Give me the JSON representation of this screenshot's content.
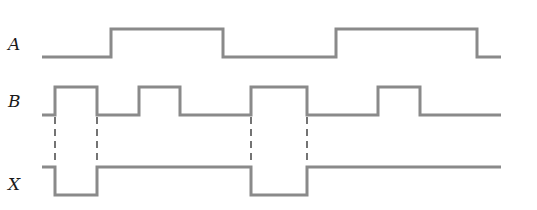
{
  "diagram": {
    "type": "timing-diagram",
    "colors": {
      "signal": "#8a8a8a",
      "dash": "#2a2a2a",
      "label": "#1a1a1a"
    },
    "signals": [
      {
        "name": "A",
        "label_y": 50,
        "high_y": 29,
        "low_y": 57,
        "points": "42,57 111,57 111,29 223,29 223,57 336,57 336,29 477,29 477,57 501,57"
      },
      {
        "name": "B",
        "label_y": 107,
        "high_y": 87,
        "low_y": 115,
        "points": "42,115 55,115 55,87 97,87 97,115 139,115 139,87 180,87 180,115 251,115 251,87 307,87 307,115 378,115 378,87 420,87 420,115 501,115"
      },
      {
        "name": "X",
        "label_y": 190,
        "high_y": 167,
        "low_y": 195,
        "points": "42,167 55,167 55,195 97,195 97,167 251,167 251,195 307,195 307,167 501,167"
      }
    ],
    "dashed_guides": [
      {
        "x": 55,
        "y1": 117,
        "y2": 165
      },
      {
        "x": 97,
        "y1": 117,
        "y2": 165
      },
      {
        "x": 251,
        "y1": 117,
        "y2": 165
      },
      {
        "x": 307,
        "y1": 117,
        "y2": 165
      }
    ]
  }
}
